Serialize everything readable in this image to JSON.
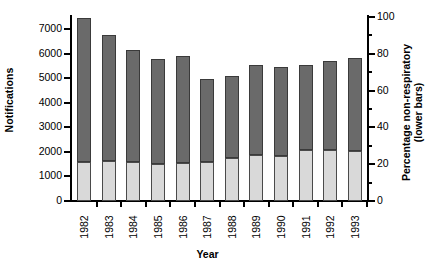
{
  "chart_data": {
    "type": "bar",
    "title": "",
    "subtitle": "",
    "xlabel": "Year",
    "ylabel": "Notifications",
    "ylabel_right": "Percentage non-respiratory (lower bars)",
    "ylabel_right_line1": "Percentage non-respiratory",
    "ylabel_right_line2": "(lower bars)",
    "categories": [
      "1982",
      "1983",
      "1984",
      "1985",
      "1986",
      "1987",
      "1988",
      "1989",
      "1990",
      "1991",
      "1992",
      "1993"
    ],
    "ylim": [
      0,
      7500
    ],
    "ylim_right": [
      0,
      100
    ],
    "yticks": [
      0,
      1000,
      2000,
      3000,
      4000,
      5000,
      6000,
      7000
    ],
    "ytick_labels": [
      "0",
      "1000",
      "2000",
      "3000",
      "4000",
      "5000",
      "6000",
      "7000"
    ],
    "yticks_right": [
      0,
      20,
      40,
      60,
      80,
      100
    ],
    "ytick_labels_right": [
      "0",
      "20",
      "40",
      "60",
      "80",
      "100"
    ],
    "yticks_right_minor": [
      10,
      30,
      50,
      70,
      90
    ],
    "grid": false,
    "legend": false,
    "stacked": true,
    "series": [
      {
        "name": "Total notifications (upper bars)",
        "axis": "left",
        "color": "#6a6a6a",
        "values": [
          7450,
          6750,
          6170,
          5780,
          5900,
          4990,
          5080,
          5530,
          5470,
          5550,
          5720,
          5840
        ]
      },
      {
        "name": "Percentage non-respiratory (lower bars)",
        "axis": "right",
        "color": "#d9d9d9",
        "values": [
          21,
          22,
          21,
          20,
          20.5,
          21,
          23.5,
          25,
          24.5,
          27.5,
          27.5,
          27
        ]
      }
    ]
  }
}
